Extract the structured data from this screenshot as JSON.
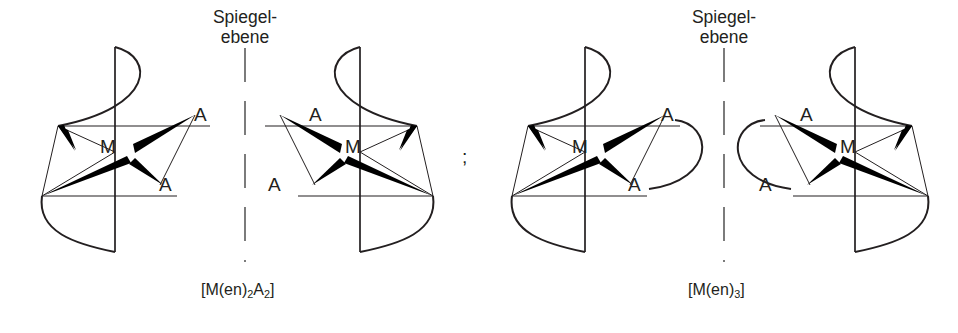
{
  "figure": {
    "background_color": "#ffffff",
    "ink_color": "#231f20",
    "wedge_color": "#000000",
    "separator": ";"
  },
  "mirror_planes": [
    {
      "id": "mirror-plane-left",
      "line1": "Spiegel-",
      "line2": "ebene",
      "x": 245
    },
    {
      "id": "mirror-plane-right",
      "line1": "Spiegel-",
      "line2": "ebene",
      "x": 724
    }
  ],
  "complexes": [
    {
      "id": "complex-1",
      "formula_plain": "[M(en)2A2]",
      "formula_prefix": "[M(en)",
      "formula_sub1": "2",
      "formula_mid": "A",
      "formula_sub2": "2",
      "formula_suffix": "]",
      "metal_label": "M",
      "chirality": "Lambda",
      "ligand_labels": [
        "A",
        "A"
      ],
      "chelate_arcs": 2,
      "position": "far-left"
    },
    {
      "id": "complex-2",
      "formula_plain": "[M(en)2A2]",
      "metal_label": "M",
      "chirality": "Delta",
      "ligand_labels": [
        "A",
        "A"
      ],
      "chelate_arcs": 2,
      "position": "center-left",
      "note": "Spiegelbild von complex-1"
    },
    {
      "id": "complex-3",
      "formula_plain": "[M(en)3]",
      "formula_prefix": "[M(en)",
      "formula_sub1": "3",
      "formula_suffix": "]",
      "metal_label": "M",
      "chirality": "Lambda",
      "ligand_labels": [
        "A",
        "A"
      ],
      "chelate_arcs": 3,
      "position": "center-right"
    },
    {
      "id": "complex-4",
      "formula_plain": "[M(en)3]",
      "metal_label": "M",
      "chirality": "Delta",
      "ligand_labels": [
        "A",
        "A"
      ],
      "chelate_arcs": 3,
      "position": "far-right",
      "note": "Spiegelbild von complex-3"
    }
  ],
  "formulas": [
    {
      "id": "formula-left",
      "prefix": "[M(en)",
      "sub1": "2",
      "mid": "A",
      "sub2": "2",
      "suffix": "]",
      "x": 245
    },
    {
      "id": "formula-right",
      "prefix": "[M(en)",
      "sub1": "3",
      "mid": "",
      "sub2": "",
      "suffix": "]",
      "x": 724
    }
  ],
  "atom_labels": [
    {
      "id": "c1-a-top",
      "text": "A",
      "x": 194,
      "y": 104
    },
    {
      "id": "c1-a-bottom",
      "text": "A",
      "x": 159,
      "y": 174
    },
    {
      "id": "c1-metal",
      "text": "M",
      "x": 100,
      "y": 136
    },
    {
      "id": "c2-a-top",
      "text": "A",
      "x": 309,
      "y": 104
    },
    {
      "id": "c2-a-bottom",
      "text": "A",
      "x": 268,
      "y": 174
    },
    {
      "id": "c2-metal",
      "text": "M",
      "x": 345,
      "y": 136
    },
    {
      "id": "c3-a-top",
      "text": "A",
      "x": 661,
      "y": 104
    },
    {
      "id": "c3-a-bottom",
      "text": "A",
      "x": 628,
      "y": 174
    },
    {
      "id": "c3-metal",
      "text": "M",
      "x": 572,
      "y": 136
    },
    {
      "id": "c4-a-top",
      "text": "A",
      "x": 800,
      "y": 104
    },
    {
      "id": "c4-a-bottom",
      "text": "A",
      "x": 759,
      "y": 174
    },
    {
      "id": "c4-metal",
      "text": "M",
      "x": 840,
      "y": 136
    }
  ]
}
